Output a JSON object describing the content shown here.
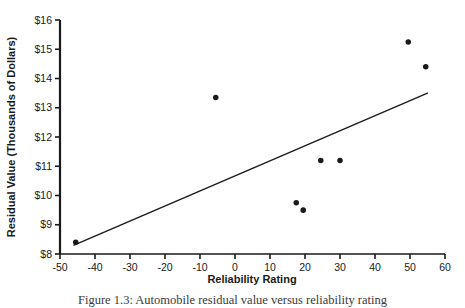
{
  "figure": {
    "caption": "Figure 1.3: Automobile residual value versus reliability rating",
    "background_color": "#ffffff",
    "ink_color": "#1a1a1a"
  },
  "chart_data": {
    "type": "scatter",
    "title": "",
    "xlabel": "Reliability Rating",
    "ylabel": "Residual Value (Thousands of Dollars)",
    "xlim": [
      -50,
      60
    ],
    "ylim": [
      8,
      16
    ],
    "xticks": [
      -50,
      -40,
      -30,
      -20,
      -10,
      0,
      10,
      20,
      30,
      40,
      50,
      60
    ],
    "xtick_labels": [
      "-50",
      "-40",
      "-30",
      "-20",
      "-10",
      "0",
      "10",
      "20",
      "30",
      "40",
      "50",
      "60"
    ],
    "yticks": [
      8,
      9,
      10,
      11,
      12,
      13,
      14,
      15,
      16
    ],
    "ytick_labels": [
      "$8",
      "$9",
      "$10",
      "$11",
      "$12",
      "$13",
      "$14",
      "$15",
      "$16"
    ],
    "grid": false,
    "legend": null,
    "marker": "filled-circle",
    "marker_color": "#1a1a1a",
    "marker_size": 4,
    "points": [
      {
        "x": -45.5,
        "y": 8.4
      },
      {
        "x": -5.5,
        "y": 13.35
      },
      {
        "x": 17.5,
        "y": 9.75
      },
      {
        "x": 19.5,
        "y": 9.5
      },
      {
        "x": 24.5,
        "y": 11.2
      },
      {
        "x": 30.0,
        "y": 11.2
      },
      {
        "x": 49.5,
        "y": 15.25
      },
      {
        "x": 54.5,
        "y": 14.4
      }
    ],
    "trendline": {
      "type": "line",
      "color": "#1a1a1a",
      "width": 1.4,
      "x": [
        -46,
        55
      ],
      "y": [
        8.3,
        13.5
      ]
    }
  }
}
